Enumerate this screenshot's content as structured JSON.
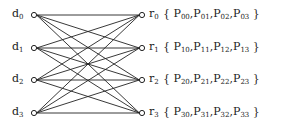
{
  "diagram": {
    "type": "bipartite-graph",
    "left_nodes": [
      {
        "base": "d",
        "sub": "0",
        "y": 15
      },
      {
        "base": "d",
        "sub": "1",
        "y": 48
      },
      {
        "base": "d",
        "sub": "2",
        "y": 80
      },
      {
        "base": "d",
        "sub": "3",
        "y": 113
      }
    ],
    "right_nodes": [
      {
        "base": "r",
        "sub": "0",
        "y": 15,
        "set": [
          {
            "b": "P",
            "s": "00"
          },
          {
            "b": "P",
            "s": "01"
          },
          {
            "b": "P",
            "s": "02"
          },
          {
            "b": "P",
            "s": "03"
          }
        ]
      },
      {
        "base": "r",
        "sub": "1",
        "y": 48,
        "set": [
          {
            "b": "P",
            "s": "10"
          },
          {
            "b": "P",
            "s": "11"
          },
          {
            "b": "P",
            "s": "12"
          },
          {
            "b": "P",
            "s": "13"
          }
        ]
      },
      {
        "base": "r",
        "sub": "2",
        "y": 80,
        "set": [
          {
            "b": "P",
            "s": "20"
          },
          {
            "b": "P",
            "s": "21"
          },
          {
            "b": "P",
            "s": "22"
          },
          {
            "b": "P",
            "s": "23"
          }
        ]
      },
      {
        "base": "r",
        "sub": "3",
        "y": 113,
        "set": [
          {
            "b": "P",
            "s": "30"
          },
          {
            "b": "P",
            "s": "31"
          },
          {
            "b": "P",
            "s": "32"
          },
          {
            "b": "P",
            "s": "33"
          }
        ]
      }
    ],
    "edges": "complete-bipartite",
    "left_x": 34,
    "right_x": 142,
    "node_radius": 2.6,
    "line_color": "#222222"
  }
}
